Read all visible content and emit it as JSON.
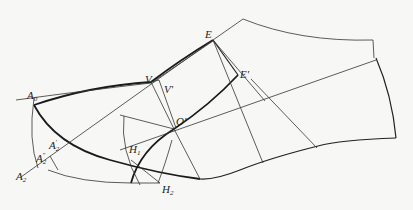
{
  "diagram": {
    "type": "shoe-last pattern drafting construction",
    "labels": {
      "E": "E",
      "E_prime": "E′",
      "V": "V",
      "V_prime": "V′",
      "O_prime": "O′",
      "A0_main": "A",
      "A0_sub": "0",
      "A2_main": "A",
      "A2_sub": "2",
      "A2p_main": "A",
      "A2p_sub": "2",
      "A2p_mark": "′",
      "A2pp_main": "A",
      "A2pp_sub": "2",
      "A2pp_mark": "″",
      "H1_main": "H",
      "H1_sub": "1",
      "H2_main": "H",
      "H2_sub": "2"
    },
    "colors": {
      "background": "#f7f7f5",
      "line": "#222222"
    }
  }
}
